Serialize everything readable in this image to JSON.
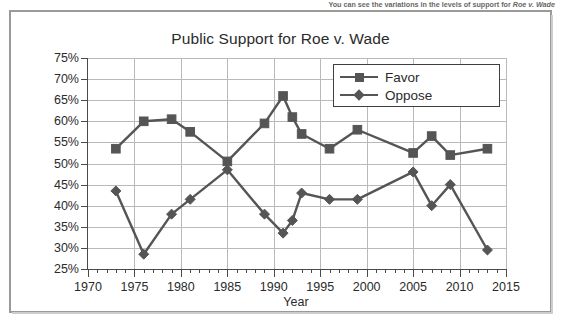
{
  "document": {
    "caption_text": "You can see the variations in the levels of support for ",
    "caption_italic": "Roe v. Wade"
  },
  "chart_data": {
    "type": "line",
    "title": "Public Support for Roe v. Wade",
    "xlabel": "Year",
    "ylabel": "",
    "xlim": [
      1970,
      2015
    ],
    "ylim": [
      25,
      75
    ],
    "grid": true,
    "legend_position": "top-right",
    "x_ticks": [
      1970,
      1975,
      1980,
      1985,
      1990,
      1995,
      2000,
      2005,
      2010,
      2015
    ],
    "x_tick_labels": [
      "1970",
      "1975",
      "1980",
      "1985",
      "1990",
      "1995",
      "2000",
      "2005",
      "2010",
      "2015"
    ],
    "y_ticks": [
      25,
      30,
      35,
      40,
      45,
      50,
      55,
      60,
      65,
      70,
      75
    ],
    "y_tick_labels": [
      "25%",
      "30%",
      "35%",
      "40%",
      "45%",
      "50%",
      "55%",
      "60%",
      "65%",
      "70%",
      "75%"
    ],
    "x_minor_tick_step": 1,
    "series": [
      {
        "name": "Favor",
        "color": "#555555",
        "marker": "square",
        "points": [
          {
            "x": 1973,
            "y": 53.5
          },
          {
            "x": 1976,
            "y": 60.0
          },
          {
            "x": 1979,
            "y": 60.5
          },
          {
            "x": 1981,
            "y": 57.5
          },
          {
            "x": 1985,
            "y": 50.5
          },
          {
            "x": 1989,
            "y": 59.5
          },
          {
            "x": 1991,
            "y": 66.0
          },
          {
            "x": 1992,
            "y": 61.0
          },
          {
            "x": 1993,
            "y": 57.0
          },
          {
            "x": 1996,
            "y": 53.5
          },
          {
            "x": 1999,
            "y": 58.0
          },
          {
            "x": 2005,
            "y": 52.5
          },
          {
            "x": 2007,
            "y": 56.5
          },
          {
            "x": 2009,
            "y": 52.0
          },
          {
            "x": 2013,
            "y": 53.5
          }
        ]
      },
      {
        "name": "Oppose",
        "color": "#555555",
        "marker": "diamond",
        "points": [
          {
            "x": 1973,
            "y": 43.5
          },
          {
            "x": 1976,
            "y": 28.5
          },
          {
            "x": 1979,
            "y": 38.0
          },
          {
            "x": 1981,
            "y": 41.5
          },
          {
            "x": 1985,
            "y": 48.5
          },
          {
            "x": 1989,
            "y": 38.0
          },
          {
            "x": 1991,
            "y": 33.5
          },
          {
            "x": 1992,
            "y": 36.5
          },
          {
            "x": 1993,
            "y": 43.0
          },
          {
            "x": 1996,
            "y": 41.5
          },
          {
            "x": 1999,
            "y": 41.5
          },
          {
            "x": 2005,
            "y": 48.0
          },
          {
            "x": 2007,
            "y": 40.0
          },
          {
            "x": 2009,
            "y": 45.0
          },
          {
            "x": 2013,
            "y": 29.5
          }
        ]
      }
    ],
    "legend": [
      {
        "label": "Favor",
        "marker": "square"
      },
      {
        "label": "Oppose",
        "marker": "diamond"
      }
    ]
  }
}
